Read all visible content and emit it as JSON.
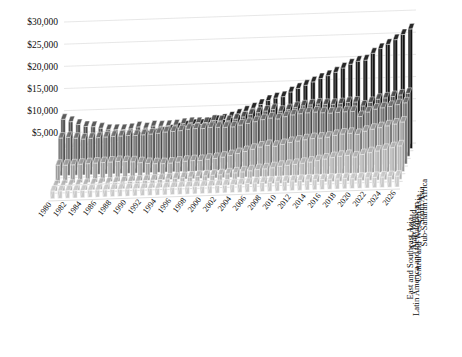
{
  "chart": {
    "type": "bar-3d",
    "title": "",
    "background": "#ffffff",
    "grid": true,
    "legend_position": "depth-axis-right"
  },
  "axes": {
    "y": {
      "label": "",
      "ticks": [
        "$30,000",
        "$25,000",
        "$20,000",
        "$15,000",
        "$10,000",
        "$5,000"
      ],
      "tick_values": [
        30000,
        25000,
        20000,
        15000,
        10000,
        5000
      ],
      "min": 0,
      "max": 30000,
      "step": 5000
    },
    "x": {
      "label": "",
      "tick_labels": [
        "1980",
        "1982",
        "1984",
        "1986",
        "1988",
        "1990",
        "1992",
        "1994",
        "1996",
        "1998",
        "2000",
        "2002",
        "2004",
        "2006",
        "2008",
        "2010",
        "2012",
        "2014",
        "2016",
        "2018",
        "2020",
        "2022",
        "2024",
        "2026"
      ]
    },
    "z": {
      "label": "",
      "categories": [
        "Sub-Saharan Africa",
        "South Asia",
        "Central and Western Asia",
        "Latin America and the Caribbean",
        "Arab World",
        "East and Southeast Asia"
      ]
    }
  },
  "colors": {
    "series": [
      "#c9c9c9",
      "#b3b3b3",
      "#9a9a9a",
      "#6e6e6e",
      "#4a4a4a",
      "#111111"
    ],
    "grid": "#dcdcdc",
    "text": "#0d0d0d",
    "background": "#ffffff"
  },
  "chart_data": {
    "type": "bar",
    "title": "",
    "xlabel": "",
    "ylabel": "",
    "ylim": [
      0,
      30000
    ],
    "grid": true,
    "legend_position": "depth-axis-right",
    "categories": [
      1980,
      1981,
      1982,
      1983,
      1984,
      1985,
      1986,
      1987,
      1988,
      1989,
      1990,
      1991,
      1992,
      1993,
      1994,
      1995,
      1996,
      1997,
      1998,
      1999,
      2000,
      2001,
      2002,
      2003,
      2004,
      2005,
      2006,
      2007,
      2008,
      2009,
      2010,
      2011,
      2012,
      2013,
      2014,
      2015,
      2016,
      2017,
      2018,
      2019,
      2020,
      2021,
      2022,
      2023,
      2024,
      2025,
      2026
    ],
    "series": [
      {
        "name": "Sub-Saharan Africa",
        "color": "#c9c9c9",
        "values": [
          1750,
          1730,
          1700,
          1650,
          1620,
          1630,
          1620,
          1600,
          1620,
          1610,
          1600,
          1580,
          1550,
          1540,
          1540,
          1560,
          1590,
          1610,
          1620,
          1630,
          1650,
          1670,
          1700,
          1740,
          1800,
          1860,
          1930,
          2000,
          2060,
          2050,
          2110,
          2160,
          2200,
          2240,
          2280,
          2280,
          2260,
          2270,
          2280,
          2290,
          2210,
          2270,
          2310,
          2330,
          2360,
          2400,
          2450
        ]
      },
      {
        "name": "South Asia",
        "color": "#b3b3b3",
        "values": [
          1150,
          1170,
          1200,
          1240,
          1270,
          1310,
          1350,
          1390,
          1470,
          1530,
          1590,
          1610,
          1670,
          1720,
          1790,
          1880,
          1970,
          2040,
          2120,
          2220,
          2280,
          2350,
          2420,
          2560,
          2720,
          2890,
          3080,
          3290,
          3400,
          3590,
          3860,
          4010,
          4170,
          4360,
          4580,
          4850,
          5160,
          5420,
          5660,
          5790,
          5400,
          5880,
          6250,
          6560,
          6880,
          7200,
          7550
        ]
      },
      {
        "name": "Central and Western Asia",
        "color": "#9a9a9a",
        "values": [
          4100,
          4050,
          4080,
          4150,
          4220,
          4300,
          4350,
          4420,
          4480,
          4400,
          4300,
          4050,
          3800,
          3700,
          3650,
          3720,
          3880,
          4020,
          4100,
          4080,
          4300,
          4420,
          4650,
          4950,
          5350,
          5750,
          6200,
          6650,
          6950,
          6700,
          7050,
          7450,
          7700,
          7950,
          8150,
          8200,
          8350,
          8700,
          8950,
          9050,
          8750,
          9400,
          9800,
          10100,
          10450,
          10800,
          11200
        ]
      },
      {
        "name": "Latin America and the Caribbean",
        "color": "#6e6e6e",
        "values": [
          8500,
          8600,
          8350,
          8100,
          8200,
          8300,
          8400,
          8480,
          8500,
          8550,
          8500,
          8600,
          8700,
          8820,
          9050,
          9120,
          9250,
          9500,
          9600,
          9550,
          9750,
          9700,
          9650,
          9700,
          10050,
          10350,
          10700,
          11100,
          11400,
          11150,
          11600,
          11950,
          12150,
          12300,
          12400,
          12200,
          12050,
          12150,
          12250,
          12250,
          11050,
          12000,
          12600,
          12850,
          13100,
          13450,
          13800
        ]
      },
      {
        "name": "Arab World",
        "color": "#4a4a4a",
        "values": [
          11000,
          10400,
          9700,
          9200,
          9100,
          8700,
          8300,
          8250,
          8200,
          8350,
          8700,
          8400,
          8800,
          8700,
          8750,
          8850,
          9100,
          9250,
          9200,
          9150,
          9600,
          9450,
          9400,
          9700,
          10150,
          10650,
          11000,
          11300,
          11600,
          11150,
          11450,
          11900,
          12200,
          12350,
          12500,
          12350,
          12300,
          12400,
          12600,
          12650,
          11700,
          12450,
          13100,
          13350,
          13600,
          13900,
          14200
        ]
      },
      {
        "name": "East and Southeast Asia",
        "color": "#111111",
        "values": [
          2700,
          2820,
          2950,
          3100,
          3300,
          3450,
          3600,
          3850,
          4150,
          4400,
          4600,
          4900,
          5250,
          5600,
          6000,
          6400,
          6800,
          7100,
          7050,
          7350,
          7800,
          8050,
          8500,
          9050,
          9700,
          10350,
          11100,
          11950,
          12450,
          12700,
          13700,
          14450,
          15100,
          15800,
          16500,
          17100,
          17800,
          18700,
          19500,
          20100,
          20300,
          21800,
          22800,
          23700,
          24700,
          25800,
          27000
        ]
      }
    ]
  }
}
